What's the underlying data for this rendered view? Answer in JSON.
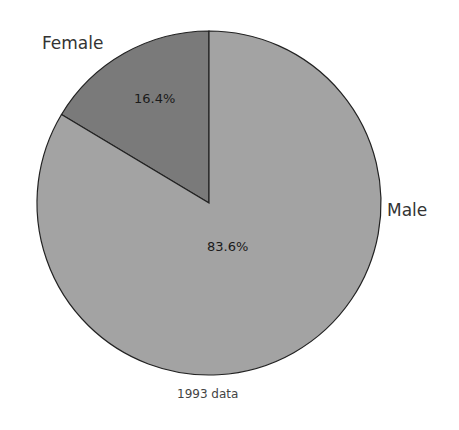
{
  "chart_data": {
    "type": "pie",
    "title": "",
    "caption": "1993 data",
    "slices": [
      {
        "label": "Female",
        "value": 16.4,
        "display": "16.4%",
        "color": "#7a7a7a"
      },
      {
        "label": "Male",
        "value": 83.6,
        "display": "83.6%",
        "color": "#a3a3a3"
      }
    ],
    "start_angle": "12 o'clock, counter-clockwise for Female",
    "legend": "none (direct labels)"
  },
  "labels": {
    "female": "Female",
    "male": "Male",
    "female_pct": "16.4%",
    "male_pct": "83.6%",
    "caption": "1993 data"
  }
}
